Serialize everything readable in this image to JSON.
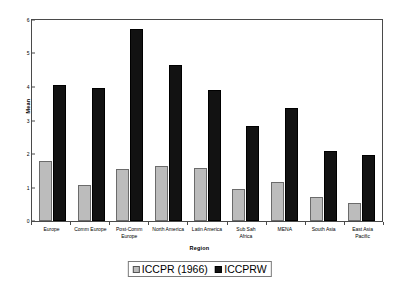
{
  "chart_data": {
    "type": "bar",
    "title": "",
    "xlabel": "Region",
    "ylabel": "Mean",
    "ylim": [
      0,
      6
    ],
    "yticks": [
      0,
      1,
      2,
      3,
      4,
      5,
      6
    ],
    "grid": false,
    "legend_position": "bottom",
    "categories": [
      "Europe",
      "Comm Europe",
      "Post-Comm\nEurope",
      "North America",
      "Latin America",
      "Sub Sah\nAfrica",
      "MENA",
      "South Asia",
      "East Asia\nPacific"
    ],
    "series": [
      {
        "name": "ICCPR (1966)",
        "color": "#bcbcbc",
        "values": [
          1.78,
          1.08,
          1.55,
          1.65,
          1.59,
          0.96,
          1.17,
          0.72,
          0.55
        ]
      },
      {
        "name": "ICCPRW",
        "color": "#121212",
        "values": [
          4.07,
          3.96,
          5.73,
          4.65,
          3.9,
          2.85,
          3.38,
          2.1,
          1.97
        ]
      }
    ]
  },
  "legend": {
    "items": [
      {
        "label": "ICCPR (1966)",
        "swatch": "light-gray-swatch"
      },
      {
        "label": "ICCPRW",
        "swatch": "black-swatch"
      }
    ]
  }
}
